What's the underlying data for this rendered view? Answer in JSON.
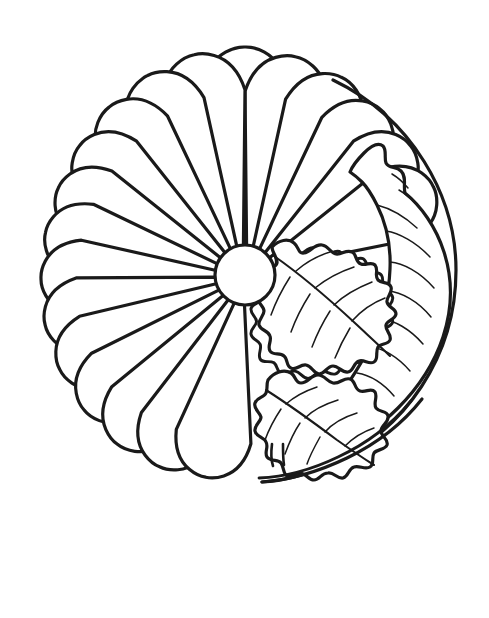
{
  "image": {
    "kind": "coloring-page-line-art",
    "subject": "chrysanthemum flower with leaves",
    "width": 489,
    "height": 618,
    "background_color": "#ffffff",
    "line_color": "#1a1a1a",
    "alt_text": "Black and white coloring page outline of a round chrysanthemum flower with many radiating petals and three lobed leaves on the right side"
  },
  "flower": {
    "center": {
      "cx": 245,
      "cy": 275,
      "r": 30
    },
    "bounds": {
      "left": 42,
      "top": 48,
      "right": 456,
      "bottom": 482
    },
    "petal_count": 14,
    "petal_labels": [
      "petal-1",
      "petal-2",
      "petal-3",
      "petal-4",
      "petal-5",
      "petal-6",
      "petal-7",
      "petal-8",
      "petal-9",
      "petal-10",
      "petal-11",
      "petal-12",
      "petal-13",
      "petal-14"
    ],
    "petals": [
      {
        "angle_deg": 270,
        "tip_r": 228,
        "half_width_deg": 13
      },
      {
        "angle_deg": 283,
        "tip_r": 224,
        "half_width_deg": 13
      },
      {
        "angle_deg": 296,
        "tip_r": 220,
        "half_width_deg": 13
      },
      {
        "angle_deg": 309,
        "tip_r": 214,
        "half_width_deg": 13
      },
      {
        "angle_deg": 322,
        "tip_r": 210,
        "half_width_deg": 13
      },
      {
        "angle_deg": 335,
        "tip_r": 208,
        "half_width_deg": 13
      },
      {
        "angle_deg": 257,
        "tip_r": 226,
        "half_width_deg": 13
      },
      {
        "angle_deg": 244,
        "tip_r": 222,
        "half_width_deg": 13
      },
      {
        "angle_deg": 231,
        "tip_r": 216,
        "half_width_deg": 13
      },
      {
        "angle_deg": 218,
        "tip_r": 210,
        "half_width_deg": 13
      },
      {
        "angle_deg": 205,
        "tip_r": 206,
        "half_width_deg": 13
      },
      {
        "angle_deg": 192,
        "tip_r": 204,
        "half_width_deg": 13
      },
      {
        "angle_deg": 179,
        "tip_r": 204,
        "half_width_deg": 13
      },
      {
        "angle_deg": 166,
        "tip_r": 206,
        "half_width_deg": 13
      },
      {
        "angle_deg": 153,
        "tip_r": 208,
        "half_width_deg": 13
      },
      {
        "angle_deg": 140,
        "tip_r": 210,
        "half_width_deg": 13
      },
      {
        "angle_deg": 127,
        "tip_r": 212,
        "half_width_deg": 13
      },
      {
        "angle_deg": 114,
        "tip_r": 210,
        "half_width_deg": 13
      },
      {
        "angle_deg": 101,
        "tip_r": 206,
        "half_width_deg": 13
      }
    ]
  },
  "leaves": [
    {
      "name": "large-right-leaf",
      "description": "long pointed leaf filling right edge of circle with many diagonal side veins",
      "vein_count": 12
    },
    {
      "name": "middle-lobed-leaf",
      "description": "oak-like lobed leaf in middle right area with central midrib",
      "vein_count": 8
    },
    {
      "name": "lower-lobed-leaf",
      "description": "small lobed leaf at lower right with short stem",
      "vein_count": 7
    }
  ]
}
